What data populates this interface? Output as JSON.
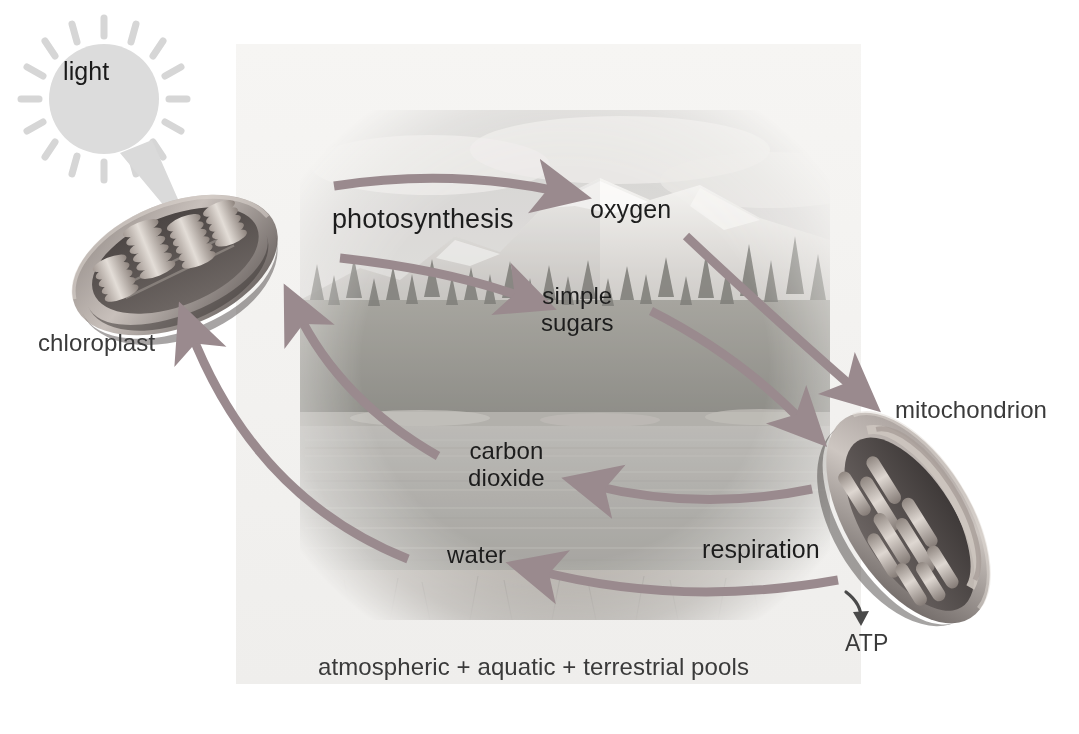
{
  "diagram": {
    "caption": "atmospheric + aquatic + terrestrial pools",
    "background_scene": "mountain-lake-forest-photograph",
    "colors": {
      "arrow": "#9a8a8e",
      "text": "#1d1d1d",
      "muted_text": "#3a3a3a",
      "sun": "#d9d9d9",
      "organelle_light": "#cfc8c6",
      "organelle_dark": "#4a4244",
      "panel": "#f2f1ef"
    }
  },
  "labels": {
    "light": "light",
    "chloroplast": "chloroplast",
    "photosynthesis": "photosynthesis",
    "oxygen": "oxygen",
    "simple_sugars_line1": "simple",
    "simple_sugars_line2": "sugars",
    "carbon_dioxide_line1": "carbon",
    "carbon_dioxide_line2": "dioxide",
    "water": "water",
    "respiration": "respiration",
    "mitochondrion": "mitochondrion",
    "atp": "ATP",
    "pools": "atmospheric + aquatic + terrestrial pools"
  },
  "flows": [
    {
      "name": "light-to-chloroplast",
      "from": "light",
      "to": "chloroplast",
      "label": ""
    },
    {
      "name": "photosynthesis-to-oxygen",
      "from": "chloroplast",
      "to": "oxygen",
      "label": "photosynthesis"
    },
    {
      "name": "photosynthesis-to-simple-sugars",
      "from": "chloroplast",
      "to": "simple sugars",
      "label": "photosynthesis"
    },
    {
      "name": "oxygen-to-mitochondrion",
      "from": "oxygen",
      "to": "mitochondrion",
      "label": ""
    },
    {
      "name": "simple-sugars-to-mitochondrion",
      "from": "simple sugars",
      "to": "mitochondrion",
      "label": ""
    },
    {
      "name": "respiration-to-carbon-dioxide",
      "from": "mitochondrion",
      "to": "carbon dioxide",
      "label": "respiration"
    },
    {
      "name": "respiration-to-water",
      "from": "mitochondrion",
      "to": "water",
      "label": "respiration"
    },
    {
      "name": "carbon-dioxide-to-chloroplast",
      "from": "carbon dioxide",
      "to": "chloroplast",
      "label": ""
    },
    {
      "name": "water-to-chloroplast",
      "from": "water",
      "to": "chloroplast",
      "label": ""
    },
    {
      "name": "mitochondrion-to-atp",
      "from": "mitochondrion",
      "to": "ATP",
      "label": ""
    }
  ],
  "organelles": [
    {
      "name": "chloroplast",
      "label": "chloroplast",
      "feature": "grana stacks of thylakoids"
    },
    {
      "name": "mitochondrion",
      "label": "mitochondrion",
      "feature": "cristae folds"
    }
  ]
}
